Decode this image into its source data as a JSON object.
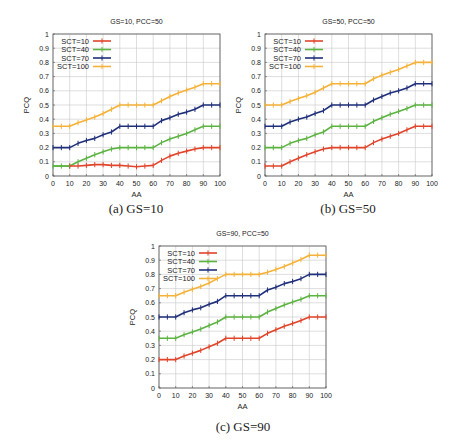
{
  "figure": {
    "panels": [
      {
        "caption": "(a) GS=10"
      },
      {
        "caption": "(b) GS=50"
      },
      {
        "caption": "(c) GS=90"
      }
    ]
  },
  "colors": {
    "SCT=10": "#e0442a",
    "SCT=40": "#5cb342",
    "SCT=70": "#1f2f7a",
    "SCT=100": "#f5b23a",
    "grid": "#c8c8c8",
    "axis": "#555555"
  },
  "chart_data": [
    {
      "type": "line",
      "title": "GS=10, PCC=50",
      "caption": "(a) GS=10",
      "xlabel": "AA",
      "ylabel": "PCQ",
      "xlim": [
        0,
        100
      ],
      "ylim": [
        0,
        1
      ],
      "xticks": [
        0,
        10,
        20,
        30,
        40,
        50,
        60,
        70,
        80,
        90,
        100
      ],
      "yticks": [
        0,
        0.1,
        0.2,
        0.3,
        0.4,
        0.5,
        0.6,
        0.7,
        0.8,
        0.9,
        1
      ],
      "grid": true,
      "legend_position": "upper left",
      "x": [
        0,
        5,
        10,
        15,
        20,
        25,
        30,
        35,
        40,
        45,
        50,
        55,
        60,
        65,
        70,
        75,
        80,
        85,
        90,
        95,
        100
      ],
      "series": [
        {
          "name": "SCT=10",
          "values": [
            0.07,
            0.07,
            0.07,
            0.07,
            0.075,
            0.08,
            0.08,
            0.075,
            0.075,
            0.07,
            0.065,
            0.07,
            0.075,
            0.11,
            0.14,
            0.16,
            0.175,
            0.19,
            0.2,
            0.2,
            0.2
          ]
        },
        {
          "name": "SCT=40",
          "values": [
            0.07,
            0.07,
            0.07,
            0.1,
            0.125,
            0.15,
            0.17,
            0.19,
            0.2,
            0.2,
            0.2,
            0.2,
            0.2,
            0.235,
            0.26,
            0.28,
            0.3,
            0.325,
            0.35,
            0.35,
            0.35
          ]
        },
        {
          "name": "SCT=70",
          "values": [
            0.2,
            0.2,
            0.2,
            0.23,
            0.25,
            0.265,
            0.29,
            0.31,
            0.35,
            0.35,
            0.35,
            0.35,
            0.35,
            0.39,
            0.41,
            0.435,
            0.45,
            0.47,
            0.5,
            0.5,
            0.5
          ]
        },
        {
          "name": "SCT=100",
          "values": [
            0.35,
            0.35,
            0.35,
            0.375,
            0.395,
            0.415,
            0.44,
            0.47,
            0.5,
            0.5,
            0.5,
            0.5,
            0.5,
            0.53,
            0.56,
            0.585,
            0.605,
            0.625,
            0.65,
            0.65,
            0.65
          ]
        }
      ]
    },
    {
      "type": "line",
      "title": "GS=50, PCC=50",
      "caption": "(b) GS=50",
      "xlabel": "AA",
      "ylabel": "PCQ",
      "xlim": [
        0,
        100
      ],
      "ylim": [
        0,
        1
      ],
      "xticks": [
        0,
        10,
        20,
        30,
        40,
        50,
        60,
        70,
        80,
        90,
        100
      ],
      "yticks": [
        0,
        0.1,
        0.2,
        0.3,
        0.4,
        0.5,
        0.6,
        0.7,
        0.8,
        0.9,
        1
      ],
      "grid": true,
      "legend_position": "upper left",
      "x": [
        0,
        5,
        10,
        15,
        20,
        25,
        30,
        35,
        40,
        45,
        50,
        55,
        60,
        65,
        70,
        75,
        80,
        85,
        90,
        95,
        100
      ],
      "series": [
        {
          "name": "SCT=10",
          "values": [
            0.07,
            0.07,
            0.07,
            0.1,
            0.125,
            0.15,
            0.17,
            0.19,
            0.2,
            0.2,
            0.2,
            0.2,
            0.2,
            0.235,
            0.26,
            0.28,
            0.3,
            0.325,
            0.35,
            0.35,
            0.35
          ]
        },
        {
          "name": "SCT=40",
          "values": [
            0.2,
            0.2,
            0.2,
            0.23,
            0.25,
            0.265,
            0.29,
            0.31,
            0.35,
            0.35,
            0.35,
            0.35,
            0.35,
            0.385,
            0.41,
            0.435,
            0.455,
            0.475,
            0.5,
            0.5,
            0.5
          ]
        },
        {
          "name": "SCT=70",
          "values": [
            0.35,
            0.35,
            0.35,
            0.38,
            0.4,
            0.415,
            0.44,
            0.46,
            0.5,
            0.5,
            0.5,
            0.5,
            0.5,
            0.535,
            0.56,
            0.585,
            0.6,
            0.62,
            0.65,
            0.65,
            0.65
          ]
        },
        {
          "name": "SCT=100",
          "values": [
            0.5,
            0.5,
            0.5,
            0.525,
            0.545,
            0.565,
            0.59,
            0.62,
            0.65,
            0.65,
            0.65,
            0.65,
            0.65,
            0.685,
            0.71,
            0.73,
            0.75,
            0.775,
            0.8,
            0.8,
            0.8
          ]
        }
      ]
    },
    {
      "type": "line",
      "title": "GS=90, PCC=50",
      "caption": "(c) GS=90",
      "xlabel": "AA",
      "ylabel": "PCQ",
      "xlim": [
        0,
        100
      ],
      "ylim": [
        0,
        1
      ],
      "xticks": [
        0,
        10,
        20,
        30,
        40,
        50,
        60,
        70,
        80,
        90,
        100
      ],
      "yticks": [
        0,
        0.1,
        0.2,
        0.3,
        0.4,
        0.5,
        0.6,
        0.7,
        0.8,
        0.9,
        1
      ],
      "grid": true,
      "legend_position": "upper left",
      "x": [
        0,
        5,
        10,
        15,
        20,
        25,
        30,
        35,
        40,
        45,
        50,
        55,
        60,
        65,
        70,
        75,
        80,
        85,
        90,
        95,
        100
      ],
      "series": [
        {
          "name": "SCT=10",
          "values": [
            0.2,
            0.2,
            0.2,
            0.225,
            0.245,
            0.265,
            0.29,
            0.315,
            0.35,
            0.35,
            0.35,
            0.35,
            0.35,
            0.385,
            0.41,
            0.435,
            0.455,
            0.475,
            0.5,
            0.5,
            0.5
          ]
        },
        {
          "name": "SCT=40",
          "values": [
            0.35,
            0.35,
            0.35,
            0.375,
            0.395,
            0.415,
            0.44,
            0.465,
            0.5,
            0.5,
            0.5,
            0.5,
            0.5,
            0.535,
            0.56,
            0.585,
            0.605,
            0.625,
            0.65,
            0.65,
            0.65
          ]
        },
        {
          "name": "SCT=70",
          "values": [
            0.5,
            0.5,
            0.5,
            0.53,
            0.55,
            0.565,
            0.59,
            0.61,
            0.65,
            0.65,
            0.65,
            0.65,
            0.65,
            0.69,
            0.71,
            0.735,
            0.75,
            0.77,
            0.8,
            0.8,
            0.8
          ]
        },
        {
          "name": "SCT=100",
          "values": [
            0.65,
            0.65,
            0.65,
            0.675,
            0.695,
            0.715,
            0.74,
            0.77,
            0.8,
            0.8,
            0.8,
            0.8,
            0.8,
            0.815,
            0.835,
            0.855,
            0.88,
            0.905,
            0.935,
            0.935,
            0.935
          ]
        }
      ]
    }
  ]
}
